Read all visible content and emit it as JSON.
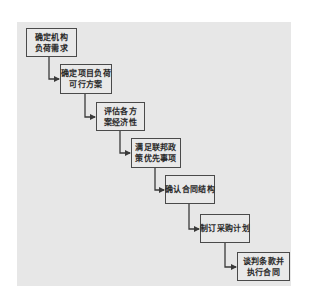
{
  "diagram": {
    "type": "staircase-flowchart",
    "colors": {
      "panel_background": "#e7e7e7",
      "box_fill": "#e9e9e9",
      "box_border": "#4a4a4a",
      "text": "#2a2a2a",
      "connector": "#3a3a3a"
    },
    "steps": [
      {
        "line1": "确定机构",
        "line2": "负荷需求"
      },
      {
        "line1": "确定项目负荷",
        "line2": "可行方案"
      },
      {
        "line1": "评估各方",
        "line2": "案经济性"
      },
      {
        "line1": "满足联邦政",
        "line2": "策优先事项"
      },
      {
        "line1": "确认合同结构",
        "line2": ""
      },
      {
        "line1": "制订采购计划",
        "line2": ""
      },
      {
        "line1": "谈判条款并",
        "line2": "执行合同"
      }
    ]
  }
}
